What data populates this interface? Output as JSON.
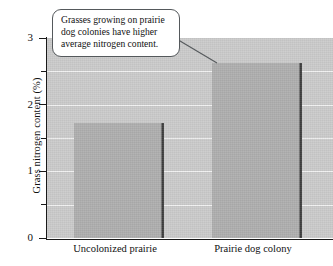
{
  "chart_data": {
    "type": "bar",
    "title": "",
    "subtitle": "",
    "xlabel": "",
    "ylabel": "Grass nitrogen content  (%)",
    "categories": [
      "Uncolonized prairie",
      "Prairie dog colony"
    ],
    "values": [
      1.72,
      2.63
    ],
    "ylim": [
      0,
      3
    ],
    "yticks": [
      0,
      1,
      2,
      3
    ],
    "ytick_labels": [
      "0",
      "1",
      "2",
      "3"
    ],
    "yminor_ticks": [
      0.5,
      1.5,
      2.5
    ],
    "gridlines": [
      0.5,
      1.0,
      1.5,
      2.0,
      2.5
    ],
    "grid": true,
    "legend": null,
    "legend_position": "none",
    "annotations": [
      {
        "text": "Grasses growing on prairie dog colonies have higher average nitrogen content.",
        "points_to_category": "Prairie dog colony",
        "style": "rounded-callout-box"
      }
    ],
    "colors": {
      "plot_background": "#cacaca",
      "bar_fill": "#adadad",
      "bar_edge_shadow": "#3d3d3d",
      "gridline": "#f1f1f1",
      "axis": "#1a1a1a",
      "callout_background": "#ffffff",
      "callout_border": "#55595c",
      "text": "#111111"
    }
  },
  "axis": {
    "y_title": "Grass nitrogen content  (%)",
    "tick_labels": [
      "3",
      "2",
      "1",
      "0"
    ]
  },
  "callout": {
    "text": "Grasses growing on prairie dog colonies have higher average nitrogen content."
  },
  "bars": [
    {
      "label": "Uncolonized prairie",
      "value": 1.72
    },
    {
      "label": "Prairie dog colony",
      "value": 2.63
    }
  ]
}
